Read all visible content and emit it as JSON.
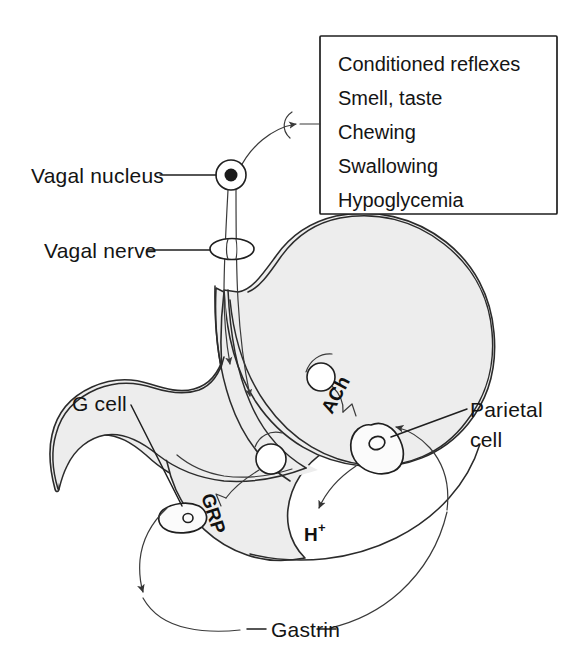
{
  "figure": {
    "background_color": "#ffffff",
    "organ_fill_color": "#ededed",
    "line_color": "#2b2b2b"
  },
  "stimulus_box": {
    "name": "cephalic-phase-stimuli",
    "items": [
      "Conditioned reflexes",
      "Smell, taste",
      "Chewing",
      "Swallowing",
      "Hypoglycemia"
    ]
  },
  "labels": {
    "vagal_nucleus": "Vagal nucleus",
    "vagal_nerve": "Vagal nerve",
    "g_cell": "G cell",
    "parietal_cell_line1": "Parietal",
    "parietal_cell_line2": "cell",
    "gastrin": "Gastrin"
  },
  "inline_labels": {
    "grp": "GRP",
    "ach": "ACh",
    "hydrogen_ion": "H",
    "hydrogen_ion_charge": "+"
  },
  "structures": [
    {
      "name": "vagal-nucleus-node",
      "type": "neuron-soma"
    },
    {
      "name": "vagal-nerve-marker",
      "type": "ellipse"
    },
    {
      "name": "ganglion-upper",
      "type": "circle"
    },
    {
      "name": "ganglion-lower",
      "type": "circle"
    },
    {
      "name": "g-cell-body",
      "type": "oval-cell"
    },
    {
      "name": "parietal-cell-body",
      "type": "triangular-cell"
    },
    {
      "name": "stomach-outline",
      "type": "organ"
    }
  ],
  "flows": [
    {
      "name": "stimuli-to-nucleus",
      "from": "stimulus_box",
      "to": "vagal_nucleus"
    },
    {
      "name": "vagal-fiber-anterior",
      "from": "vagal_nucleus",
      "to": "stomach"
    },
    {
      "name": "vagal-fiber-posterior",
      "from": "vagal_nucleus",
      "to": "stomach"
    },
    {
      "name": "ach-to-parietal-cell",
      "from": "ganglion_upper",
      "to": "parietal_cell"
    },
    {
      "name": "grp-to-g-cell",
      "from": "ganglion_lower",
      "to": "g_cell"
    },
    {
      "name": "parietal-cell-to-acid",
      "from": "parietal_cell",
      "to": "hydrogen_ion"
    },
    {
      "name": "gastrin-to-parietal-cell",
      "from": "g_cell",
      "to": "parietal_cell"
    }
  ]
}
